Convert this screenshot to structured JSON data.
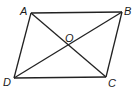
{
  "diagram": {
    "type": "parallelogram-with-diagonals",
    "stroke_color": "#222222",
    "vertices": {
      "A": {
        "label": "A",
        "x": 31,
        "y": 13,
        "lx": 20,
        "ly": 15
      },
      "B": {
        "label": "B",
        "x": 122,
        "y": 12,
        "lx": 124,
        "ly": 15
      },
      "C": {
        "label": "C",
        "x": 106,
        "y": 77,
        "lx": 108,
        "ly": 87
      },
      "D": {
        "label": "D",
        "x": 14,
        "y": 78,
        "lx": 3,
        "ly": 86
      },
      "O": {
        "label": "O",
        "x": 68,
        "y": 45,
        "lx": 65,
        "ly": 42
      }
    },
    "edges": [
      [
        "A",
        "B"
      ],
      [
        "B",
        "C"
      ],
      [
        "C",
        "D"
      ],
      [
        "D",
        "A"
      ]
    ],
    "diagonals": [
      [
        "A",
        "C"
      ],
      [
        "B",
        "D"
      ]
    ]
  }
}
